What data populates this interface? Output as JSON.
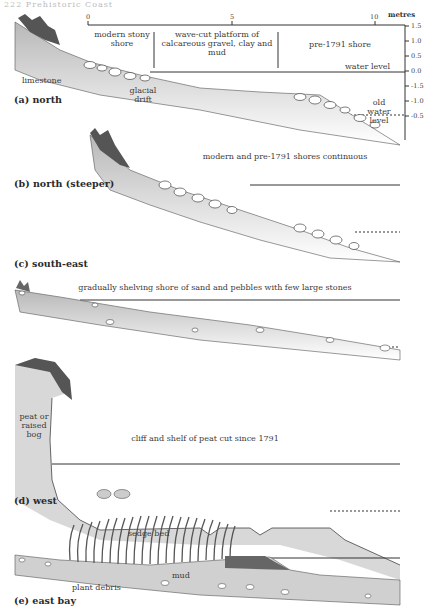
{
  "running_head": "222   Prehistoric Coast",
  "scale": {
    "unit_label": "metres",
    "x_ticks": [
      "0",
      "5",
      "10"
    ],
    "y_ticks": [
      "1.5",
      "1.0",
      "0.5",
      "0.0",
      "-1.5",
      "-1.0",
      "-0.5"
    ]
  },
  "panels": [
    {
      "id": "a",
      "label": "(a) north",
      "zones": [
        "modern stony shore",
        "wave-cut platform of calcareous gravel, clay and mud",
        "pre-1791 shore"
      ],
      "annotations": [
        "limestone",
        "glacial drift",
        "water level",
        "old water level"
      ]
    },
    {
      "id": "b",
      "label": "(b) north (steeper)",
      "caption": "modern and pre-1791 shores continuous"
    },
    {
      "id": "c",
      "label": "(c) south-east",
      "caption": "gradually shelving shore of sand and pebbles with few large stones"
    },
    {
      "id": "d",
      "label": "(d) west",
      "caption": "cliff and shelf of peat cut since 1791",
      "annotations": [
        "peat or raised bog"
      ]
    },
    {
      "id": "e",
      "label": "(e) east bay",
      "annotations": [
        "sedge bed",
        "mud",
        "plant debris"
      ]
    }
  ],
  "colors": {
    "line": "#333333",
    "fill": "#d0d0d0",
    "stone": "#ffffff",
    "vegetation": "#555555"
  }
}
